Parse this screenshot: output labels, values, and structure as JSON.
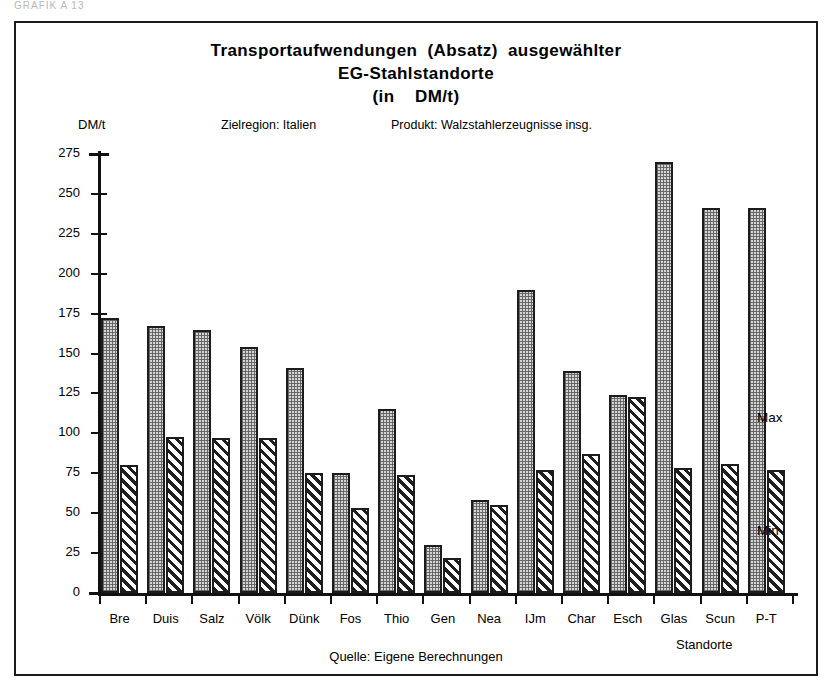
{
  "scan_header": "GRAFIK  A 13",
  "title": {
    "line1": "Transportaufwendungen  (Absatz)  ausgewählter",
    "line2": "EG-Stahlstandorte",
    "line3": "(in    DM/t)"
  },
  "subtitle": {
    "region": "Zielregion: Italien",
    "product": "Produkt: Walzstahlerzeugnisse insg."
  },
  "unit_label": "DM/t",
  "legend": {
    "max": "Max",
    "min": "Min"
  },
  "axis_caption": "Standorte",
  "source_note": "Quelle: Eigene Berechnungen",
  "chart_data": {
    "type": "bar",
    "title": "Transportaufwendungen (Absatz) ausgewählter EG-Stahlstandorte (in DM/t)",
    "subtitle": "Zielregion: Italien — Produkt: Walzstahlerzeugnisse insg.",
    "xlabel": "Standorte",
    "ylabel": "DM/t",
    "ylim": [
      0,
      275
    ],
    "yticks": [
      0,
      25,
      50,
      75,
      100,
      125,
      150,
      175,
      200,
      225,
      250,
      275
    ],
    "grid": false,
    "legend_position": "right",
    "categories": [
      "Bre",
      "Duis",
      "Salz",
      "Völk",
      "Dünk",
      "Fos",
      "Thio",
      "Gen",
      "Nea",
      "IJm",
      "Char",
      "Esch",
      "Glas",
      "Scun",
      "P-T"
    ],
    "series": [
      {
        "name": "Max",
        "values": [
          172,
          167,
          165,
          154,
          141,
          75,
          115,
          30,
          58,
          190,
          139,
          124,
          270,
          241,
          241
        ]
      },
      {
        "name": "Min",
        "values": [
          80,
          98,
          97,
          97,
          75,
          53,
          74,
          22,
          55,
          77,
          87,
          123,
          78,
          81,
          77
        ]
      }
    ]
  }
}
